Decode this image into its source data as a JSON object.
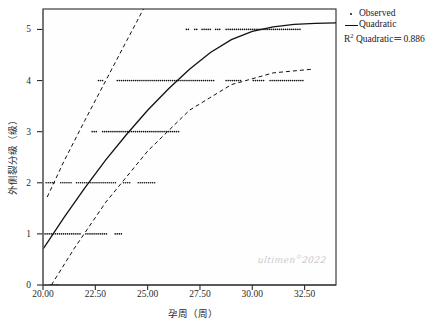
{
  "chart_data": {
    "type": "scatter",
    "title": "",
    "xlabel": "孕周（周）",
    "ylabel": "外侧裂分级（级）",
    "xlim": [
      20.0,
      34.0
    ],
    "ylim": [
      0,
      5.4
    ],
    "xticks": [
      "20.00",
      "22.50",
      "25.00",
      "27.50",
      "30.00",
      "32.50"
    ],
    "xtick_values": [
      20.0,
      22.5,
      25.0,
      27.5,
      30.0,
      32.5
    ],
    "yticks": [
      "0",
      "1",
      "2",
      "3",
      "4",
      "5"
    ],
    "ytick_values": [
      0,
      1,
      2,
      3,
      4,
      5
    ],
    "grid": false,
    "legend_position": "top-right",
    "series": [
      {
        "name": "Observed",
        "type": "scatter",
        "marker": "dot",
        "color": "#111111",
        "points_by_level": [
          {
            "y": 0,
            "x_ranges": [
              [
                20.35,
                20.75
              ]
            ]
          },
          {
            "y": 1,
            "x_ranges": [
              [
                20.1,
                21.85
              ],
              [
                22.05,
                23.1
              ],
              [
                23.45,
                23.8
              ]
            ]
          },
          {
            "y": 2,
            "x_ranges": [
              [
                20.15,
                20.55
              ],
              [
                20.85,
                21.35
              ],
              [
                21.6,
                23.55
              ],
              [
                23.85,
                24.15
              ],
              [
                24.55,
                25.35
              ]
            ]
          },
          {
            "y": 3,
            "x_ranges": [
              [
                22.35,
                22.55
              ],
              [
                22.85,
                26.55
              ]
            ]
          },
          {
            "y": 4,
            "x_ranges": [
              [
                22.65,
                22.85
              ],
              [
                23.55,
                28.25
              ],
              [
                28.75,
                29.45
              ],
              [
                30.05,
                30.55
              ],
              [
                30.85,
                32.45
              ]
            ]
          },
          {
            "y": 5,
            "x_ranges": [
              [
                26.85,
                26.95
              ],
              [
                27.25,
                27.35
              ],
              [
                27.6,
                28.0
              ],
              [
                28.25,
                28.45
              ],
              [
                28.75,
                32.3
              ]
            ]
          }
        ]
      },
      {
        "name": "Quadratic",
        "type": "line",
        "style": "solid",
        "color": "#111111",
        "fit_points": [
          [
            20.0,
            0.7
          ],
          [
            21.0,
            1.32
          ],
          [
            22.0,
            1.9
          ],
          [
            23.0,
            2.45
          ],
          [
            24.0,
            2.95
          ],
          [
            25.0,
            3.42
          ],
          [
            26.0,
            3.84
          ],
          [
            27.0,
            4.22
          ],
          [
            28.0,
            4.55
          ],
          [
            29.0,
            4.8
          ],
          [
            30.0,
            4.96
          ],
          [
            31.0,
            5.05
          ],
          [
            32.0,
            5.1
          ],
          [
            33.0,
            5.12
          ],
          [
            34.0,
            5.13
          ]
        ]
      },
      {
        "name": "Upper confidence band",
        "type": "line",
        "style": "dashed",
        "color": "#111111",
        "fit_points": [
          [
            20.2,
            1.72
          ],
          [
            21.0,
            2.42
          ],
          [
            22.0,
            3.22
          ],
          [
            23.0,
            4.0
          ],
          [
            24.0,
            4.78
          ],
          [
            24.8,
            5.4
          ]
        ]
      },
      {
        "name": "Lower confidence band",
        "type": "line",
        "style": "dashed",
        "color": "#111111",
        "fit_points": [
          [
            20.4,
            0.0
          ],
          [
            21.5,
            0.72
          ],
          [
            23.0,
            1.62
          ],
          [
            25.0,
            2.62
          ],
          [
            27.0,
            3.42
          ],
          [
            29.0,
            3.92
          ],
          [
            31.0,
            4.15
          ],
          [
            32.8,
            4.22
          ]
        ]
      }
    ],
    "annotations": {
      "r2_label": "R",
      "r2_sup": "2",
      "r2_text": " Quadratic＝0.886",
      "r2_value": 0.886
    }
  },
  "legend": {
    "items": [
      {
        "label": "Observed",
        "key": "dot"
      },
      {
        "label": "Quadratic",
        "key": "line"
      }
    ]
  },
  "watermark": {
    "text": "ultimen",
    "sup": "©",
    "year": "2022"
  }
}
